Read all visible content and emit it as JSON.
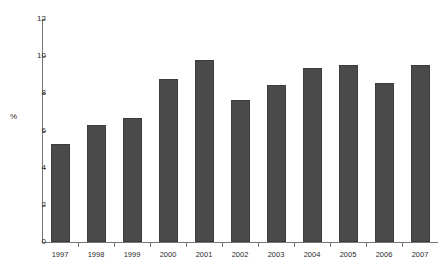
{
  "chart_data": {
    "type": "bar",
    "title": "",
    "xlabel": "",
    "ylabel": "%",
    "categories": [
      "1997",
      "1998",
      "1999",
      "2000",
      "2001",
      "2002",
      "2003",
      "2004",
      "2005",
      "2006",
      "2007"
    ],
    "values": [
      5.3,
      6.3,
      6.65,
      8.75,
      9.8,
      7.65,
      8.45,
      9.35,
      9.55,
      8.55,
      9.5
    ],
    "ylim": [
      0,
      12
    ],
    "ytick_labels": [
      "0",
      "2",
      "4",
      "6",
      "8",
      "10",
      "12"
    ],
    "ytick_values": [
      0,
      2,
      4,
      6,
      8,
      10,
      12
    ],
    "grid": false,
    "legend": false,
    "bar_color": "#4a4a4a",
    "axis_color": "#777777",
    "background_color": "#ffffff"
  }
}
